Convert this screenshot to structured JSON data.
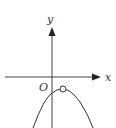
{
  "diagram": {
    "x_axis_label": "x",
    "y_axis_label": "y",
    "origin_label": "O",
    "curve": "downward-opening parabola with vertex right of y-axis, open circle at vertex",
    "colors": {
      "stroke": "#333333",
      "background": "#ffffff"
    }
  }
}
